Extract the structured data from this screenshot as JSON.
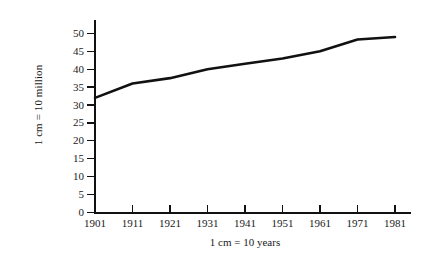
{
  "figure": {
    "name": "population-line-graph",
    "background_color": "#ffffff",
    "ink_color": "#111111"
  },
  "chart_data": {
    "type": "line",
    "title": "",
    "subtitle": "",
    "xlabel": "1 cm = 10 years",
    "ylabel": "1 cm = 10 million",
    "categories": [
      "1901",
      "1911",
      "1921",
      "1931",
      "1941",
      "1951",
      "1961",
      "1971",
      "1981"
    ],
    "x": [
      1901,
      1911,
      1921,
      1931,
      1941,
      1951,
      1961,
      1971,
      1981
    ],
    "values": [
      32,
      36,
      37.5,
      40,
      41.5,
      43,
      45,
      48.3,
      49
    ],
    "series": [
      {
        "name": "population",
        "values": [
          32,
          36,
          37.5,
          40,
          41.5,
          43,
          45,
          48.3,
          49
        ],
        "color": "#111111",
        "line_width": 2.6
      }
    ],
    "xlim": [
      1901,
      1981
    ],
    "ylim": [
      0,
      50
    ],
    "ytick_labels": [
      "0",
      "5",
      "10",
      "15",
      "20",
      "25",
      "30",
      "35",
      "40",
      "45",
      "50"
    ],
    "yticks": [
      0,
      5,
      10,
      15,
      20,
      25,
      30,
      35,
      40,
      45,
      50
    ],
    "xtick_labels": [
      "1901",
      "1911",
      "1921",
      "1931",
      "1941",
      "1951",
      "1961",
      "1971",
      "1981"
    ],
    "grid": false,
    "legend": null,
    "legend_position": "none",
    "markers": false,
    "annotations": []
  }
}
